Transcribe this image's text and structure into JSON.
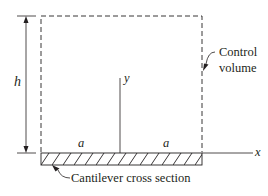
{
  "diagram": {
    "type": "control-volume-schematic",
    "labels": {
      "height": "h",
      "y_axis": "y",
      "x_axis": "x",
      "left_half_width": "a",
      "right_half_width": "a",
      "control_volume_line1": "Control",
      "control_volume_line2": "volume",
      "cross_section": "Cantilever cross section"
    },
    "colors": {
      "line": "#231f20",
      "background": "#ffffff"
    }
  }
}
